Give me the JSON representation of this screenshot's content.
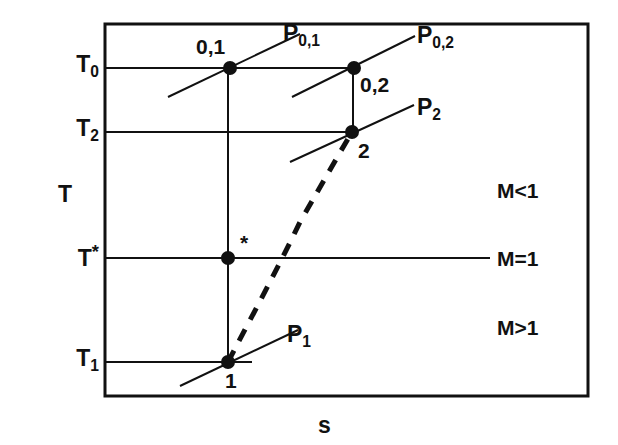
{
  "figure": {
    "type": "thermodynamic-Ts-diagram",
    "axes": {
      "y_label": "T",
      "x_label": "s",
      "frame": {
        "left": 105,
        "top": 24,
        "right": 588,
        "bottom": 396
      }
    },
    "temperature_levels": [
      {
        "id": "T0",
        "base": "T",
        "sub": "0",
        "sup": "",
        "y": 68
      },
      {
        "id": "T2",
        "base": "T",
        "sub": "2",
        "sup": "",
        "y": 132
      },
      {
        "id": "Tstar",
        "base": "T",
        "sub": "",
        "sup": "*",
        "y": 258
      },
      {
        "id": "T1",
        "base": "T",
        "sub": "1",
        "sup": "",
        "y": 362
      }
    ],
    "state_points": [
      {
        "id": "p01",
        "label": "0,1",
        "x": 230,
        "y": 68,
        "label_x": 196,
        "label_y": 36
      },
      {
        "id": "p02",
        "label": "0,2",
        "x": 354,
        "y": 68,
        "label_x": 360,
        "label_y": 74
      },
      {
        "id": "p2",
        "label": "2",
        "x": 352,
        "y": 132,
        "label_x": 358,
        "label_y": 140
      },
      {
        "id": "pstar",
        "label": "*",
        "x": 228,
        "y": 258,
        "label_x": 240,
        "label_y": 232
      },
      {
        "id": "p1",
        "label": "1",
        "x": 228,
        "y": 362,
        "label_x": 225,
        "label_y": 370
      }
    ],
    "isobar_labels": [
      {
        "id": "P01",
        "base": "P",
        "sub": "0,1",
        "x": 283,
        "y": 22
      },
      {
        "id": "P02",
        "base": "P",
        "sub": "0,2",
        "x": 417,
        "y": 24
      },
      {
        "id": "P2",
        "base": "P",
        "sub": "2",
        "x": 417,
        "y": 96
      },
      {
        "id": "P1",
        "base": "P",
        "sub": "1",
        "x": 287,
        "y": 323
      }
    ],
    "mach_regions": [
      {
        "id": "subsonic",
        "text": "M<1",
        "x": 497,
        "y": 180
      },
      {
        "id": "sonic",
        "text": "M=1",
        "x": 497,
        "y": 248
      },
      {
        "id": "supersonic",
        "text": "M>1",
        "x": 497,
        "y": 317
      }
    ],
    "colors": {
      "ink": "#111111",
      "background": "#ffffff"
    }
  },
  "chart_data": {
    "type": "line",
    "title": "",
    "xlabel": "s",
    "ylabel": "T",
    "categories": [
      "1",
      "*",
      "2",
      "0,1",
      "0,2"
    ],
    "series": [
      {
        "name": "Rayleigh line (dashed)",
        "style": "dashed",
        "points": [
          {
            "label": "1",
            "x_px": 228,
            "y_px": 362,
            "T_level": "T1"
          },
          {
            "label": "2",
            "x_px": 352,
            "y_px": 132,
            "T_level": "T2"
          }
        ]
      },
      {
        "name": "Static states",
        "style": "marker",
        "points": [
          {
            "label": "1",
            "x_px": 228,
            "y_px": 362,
            "T_level": "T1"
          },
          {
            "label": "*",
            "x_px": 228,
            "y_px": 258,
            "T_level": "T*"
          },
          {
            "label": "2",
            "x_px": 352,
            "y_px": 132,
            "T_level": "T2"
          }
        ]
      },
      {
        "name": "Stagnation states",
        "style": "marker",
        "points": [
          {
            "label": "0,1",
            "x_px": 230,
            "y_px": 68,
            "T_level": "T0"
          },
          {
            "label": "0,2",
            "x_px": 354,
            "y_px": 68,
            "T_level": "T0"
          }
        ]
      }
    ],
    "isobars": [
      {
        "name": "P0,1",
        "through": "0,1",
        "from": [
          168,
          97
        ],
        "to": [
          300,
          34
        ]
      },
      {
        "name": "P0,2",
        "through": "0,2",
        "from": [
          292,
          97
        ],
        "to": [
          415,
          36
        ]
      },
      {
        "name": "P2",
        "through": "2",
        "from": [
          290,
          162
        ],
        "to": [
          414,
          105
        ]
      },
      {
        "name": "P1",
        "through": "1",
        "from": [
          180,
          386
        ],
        "to": [
          298,
          330
        ]
      }
    ],
    "isotherms": [
      {
        "name": "T0",
        "y_px": 68,
        "from_x": 105,
        "to_x": 354
      },
      {
        "name": "T2",
        "y_px": 132,
        "from_x": 105,
        "to_x": 352
      },
      {
        "name": "T*",
        "y_px": 258,
        "from_x": 105,
        "to_x": 490
      },
      {
        "name": "T1",
        "y_px": 362,
        "from_x": 105,
        "to_x": 252
      }
    ],
    "verticals": [
      {
        "name": "state-1-to-stagnation",
        "x_px": 228,
        "from_y": 68,
        "to_y": 362
      },
      {
        "name": "state-2-to-stagnation",
        "x_px": 353,
        "from_y": 68,
        "to_y": 132
      }
    ],
    "grid": false,
    "legend": "none",
    "annotations": [
      "M<1",
      "M=1",
      "M>1"
    ]
  }
}
